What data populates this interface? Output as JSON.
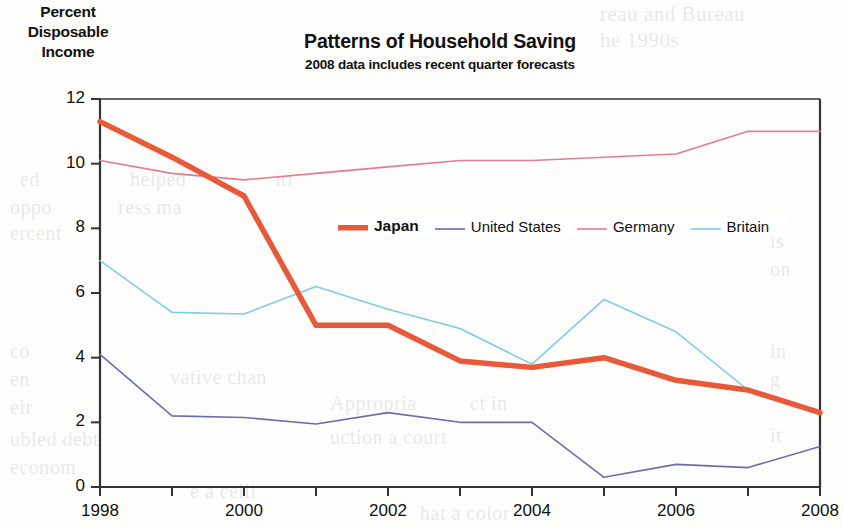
{
  "axis_title": {
    "line1": "Percent",
    "line2": "Disposable",
    "line3": "Income"
  },
  "title": "Patterns of Household Saving",
  "subtitle": "2008 data includes recent quarter forecasts",
  "legend": {
    "position": "inside-top-center",
    "items": [
      {
        "label": "Japan",
        "color": "#E8593A",
        "width": 5.5,
        "emphasis": true
      },
      {
        "label": "United States",
        "color": "#6B6FA8",
        "width": 1.6,
        "emphasis": false
      },
      {
        "label": "Germany",
        "color": "#E37C92",
        "width": 1.6,
        "emphasis": false
      },
      {
        "label": "Britain",
        "color": "#7FCDE4",
        "width": 1.6,
        "emphasis": false
      }
    ]
  },
  "background_bleed": [
    {
      "text": "reau and Bureau",
      "x": 600,
      "y": 2,
      "size": 21
    },
    {
      "text": "he 1990s",
      "x": 600,
      "y": 28,
      "size": 21
    },
    {
      "text": "ed",
      "x": 20,
      "y": 168,
      "size": 20
    },
    {
      "text": "helped",
      "x": 130,
      "y": 168,
      "size": 20
    },
    {
      "text": "iti",
      "x": 275,
      "y": 168,
      "size": 20
    },
    {
      "text": "oppo",
      "x": 10,
      "y": 196,
      "size": 20
    },
    {
      "text": "ress ma",
      "x": 118,
      "y": 196,
      "size": 20
    },
    {
      "text": "ercent",
      "x": 10,
      "y": 222,
      "size": 20
    },
    {
      "text": "co",
      "x": 10,
      "y": 340,
      "size": 20
    },
    {
      "text": "en",
      "x": 10,
      "y": 368,
      "size": 20
    },
    {
      "text": "eir",
      "x": 10,
      "y": 396,
      "size": 20
    },
    {
      "text": "vative chan",
      "x": 170,
      "y": 366,
      "size": 20
    },
    {
      "text": "Appropria",
      "x": 330,
      "y": 392,
      "size": 20
    },
    {
      "text": "ubled debt",
      "x": 10,
      "y": 428,
      "size": 20
    },
    {
      "text": "econom",
      "x": 10,
      "y": 456,
      "size": 20
    },
    {
      "text": "e a ceili",
      "x": 190,
      "y": 480,
      "size": 20
    },
    {
      "text": "uction a court",
      "x": 330,
      "y": 426,
      "size": 20
    },
    {
      "text": "ct in",
      "x": 470,
      "y": 392,
      "size": 20
    },
    {
      "text": "is",
      "x": 770,
      "y": 230,
      "size": 20
    },
    {
      "text": "on",
      "x": 770,
      "y": 258,
      "size": 20
    },
    {
      "text": "in",
      "x": 770,
      "y": 340,
      "size": 20
    },
    {
      "text": "g",
      "x": 770,
      "y": 368,
      "size": 20
    },
    {
      "text": "it",
      "x": 770,
      "y": 424,
      "size": 20
    },
    {
      "text": "hat a color",
      "x": 420,
      "y": 502,
      "size": 20
    }
  ],
  "chart_data": {
    "type": "line",
    "title": "Patterns of Household Saving",
    "subtitle": "2008 data includes recent quarter forecasts",
    "xlabel": "",
    "ylabel": "Percent Disposable Income",
    "x": [
      1998,
      1999,
      2000,
      2001,
      2002,
      2003,
      2004,
      2005,
      2006,
      2007,
      2008
    ],
    "xtick_labels": [
      "1998",
      "2000",
      "2002",
      "2004",
      "2006",
      "2008"
    ],
    "xtick_values": [
      1998,
      2000,
      2002,
      2004,
      2006,
      2008
    ],
    "xlim": [
      1998,
      2008
    ],
    "ytick_labels": [
      "0",
      "2",
      "4",
      "6",
      "8",
      "10",
      "12"
    ],
    "ytick_values": [
      0,
      2,
      4,
      6,
      8,
      10,
      12
    ],
    "ylim": [
      0,
      12
    ],
    "grid": false,
    "series": [
      {
        "name": "Japan",
        "color": "#E8593A",
        "width": 5.5,
        "values": [
          11.3,
          10.2,
          9.0,
          5.0,
          5.0,
          3.9,
          3.7,
          4.0,
          3.3,
          3.0,
          2.3
        ]
      },
      {
        "name": "United States",
        "color": "#6B6FA8",
        "width": 1.6,
        "values": [
          4.1,
          2.2,
          2.15,
          1.95,
          2.3,
          2.0,
          2.0,
          0.3,
          0.7,
          0.6,
          1.25
        ]
      },
      {
        "name": "Germany",
        "color": "#E37C92",
        "width": 1.6,
        "values": [
          10.1,
          9.7,
          9.5,
          9.7,
          9.9,
          10.1,
          10.1,
          10.2,
          10.3,
          11.0,
          11.0
        ]
      },
      {
        "name": "Britain",
        "color": "#7FCDE4",
        "width": 1.6,
        "values": [
          7.0,
          5.4,
          5.35,
          6.2,
          5.5,
          4.9,
          3.8,
          5.8,
          4.8,
          3.0,
          2.3
        ]
      }
    ]
  }
}
